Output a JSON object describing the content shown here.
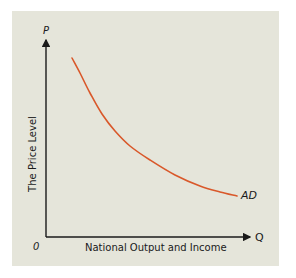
{
  "chart_data": {
    "type": "line",
    "title": "",
    "xlabel": "National Output and Income",
    "ylabel": "The Price Level",
    "x_axis_symbol": "Q",
    "y_axis_symbol": "P",
    "origin_label": "0",
    "grid": false,
    "legend": null,
    "ticks": {
      "x": [],
      "y": []
    },
    "series": [
      {
        "name": "AD",
        "label": "AD",
        "color": "#d9582a",
        "shape": "downward-sloping convex curve",
        "points_pixel": [
          [
            72,
            58
          ],
          [
            80,
            73
          ],
          [
            90,
            93
          ],
          [
            102,
            114
          ],
          [
            115,
            131
          ],
          [
            130,
            146
          ],
          [
            150,
            160
          ],
          [
            175,
            175
          ],
          [
            200,
            186
          ],
          [
            220,
            192
          ],
          [
            237,
            196
          ]
        ]
      }
    ],
    "colors": {
      "panel_background": "#e5e5da",
      "axis": "#1a1a1a",
      "curve": "#d9582a"
    }
  }
}
